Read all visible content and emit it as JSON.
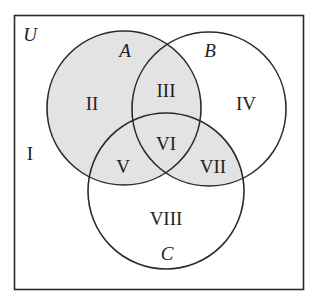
{
  "diagram": {
    "type": "venn-diagram",
    "universe_label": "U",
    "colors": {
      "shade": "#e3e3e3",
      "stroke": "#2a2a2a",
      "background": "#ffffff"
    },
    "sets": [
      {
        "id": "A",
        "label": "A",
        "shaded": true
      },
      {
        "id": "B",
        "label": "B",
        "shaded": false
      },
      {
        "id": "C",
        "label": "C",
        "shaded": false
      }
    ],
    "regions": [
      {
        "id": "I",
        "label": "I",
        "description": "outside A, B, C",
        "shaded": false
      },
      {
        "id": "II",
        "label": "II",
        "description": "A only",
        "shaded": true
      },
      {
        "id": "III",
        "label": "III",
        "description": "A and B, not C",
        "shaded": true
      },
      {
        "id": "IV",
        "label": "IV",
        "description": "B only",
        "shaded": false
      },
      {
        "id": "V",
        "label": "V",
        "description": "A and C, not B",
        "shaded": true
      },
      {
        "id": "VI",
        "label": "VI",
        "description": "A and B and C",
        "shaded": true
      },
      {
        "id": "VII",
        "label": "VII",
        "description": "B and C, not A",
        "shaded": true
      },
      {
        "id": "VIII",
        "label": "VIII",
        "description": "C only",
        "shaded": false
      }
    ]
  }
}
